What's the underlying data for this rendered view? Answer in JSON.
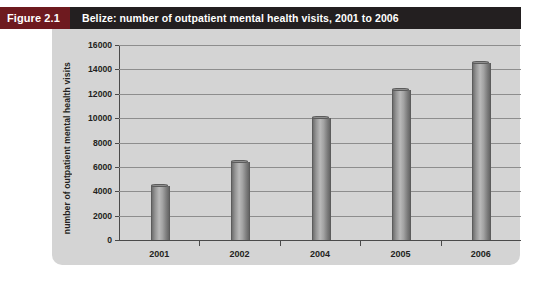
{
  "figure": {
    "label": "Figure 2.1",
    "title": "Belize: number of outpatient mental health visits, 2001 to 2006"
  },
  "colors": {
    "title_bar": "#231f20",
    "figure_label_bg": "#6e1a1f",
    "panel_bg": "#d4d4d4",
    "bar_fill": "#9a9a9a",
    "gridline": "#8d8d8d",
    "axis": "#4a4a4a",
    "text": "#231f20"
  },
  "chart_data": {
    "type": "bar",
    "title": "Belize: number of outpatient mental health visits, 2001 to 2006",
    "subtitle": "",
    "xlabel": "",
    "ylabel": "number of outpatient mental health visits",
    "categories": [
      "2001",
      "2002",
      "2004",
      "2005",
      "2006"
    ],
    "values": [
      4400,
      6400,
      10000,
      12300,
      14500
    ],
    "ylim": [
      0,
      16000
    ],
    "ytick_step": 2000,
    "yticks": [
      0,
      2000,
      4000,
      6000,
      8000,
      10000,
      12000,
      14000,
      16000
    ],
    "ytick_labels": [
      "0",
      "2000",
      "4000",
      "6000",
      "8000",
      "10000",
      "12000",
      "14000",
      "16000"
    ],
    "grid": true,
    "grid_axis": "y",
    "legend": false,
    "legend_position": "none",
    "series": [
      {
        "name": "outpatient mental health visits",
        "values": [
          4400,
          6400,
          10000,
          12300,
          14500
        ]
      }
    ]
  }
}
